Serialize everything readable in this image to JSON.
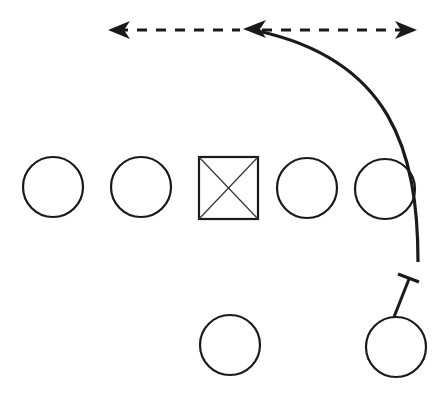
{
  "diagram": {
    "type": "football-play",
    "background": "#ffffff",
    "stroke": "#1a1a1a",
    "center": {
      "symbol": "square-with-x",
      "x": 200,
      "y": 158,
      "size": 58
    },
    "line_players": [
      {
        "id": "LT",
        "cx": 53,
        "cy": 187,
        "r": 30
      },
      {
        "id": "LG",
        "cx": 141,
        "cy": 187,
        "r": 30
      },
      {
        "id": "RG",
        "cx": 307,
        "cy": 188,
        "r": 30
      },
      {
        "id": "RT",
        "cx": 385,
        "cy": 189,
        "r": 30
      }
    ],
    "backfield_players": [
      {
        "id": "QB",
        "cx": 230,
        "cy": 345,
        "r": 30
      },
      {
        "id": "RB",
        "cx": 396,
        "cy": 347,
        "r": 30
      }
    ],
    "route": {
      "description": "curved route from right tackle area up to mid-field arrow",
      "path": "M 418 262 C 418 150 380 60 248 30"
    },
    "dashed_option": {
      "y": 30,
      "x_left": 110,
      "x_mid": 245,
      "x_right": 415
    },
    "block": {
      "x1": 396,
      "y1": 317,
      "x2": 408,
      "y2": 280,
      "bar_x1": 398,
      "bar_y1": 276,
      "bar_x2": 418,
      "bar_y2": 283
    }
  }
}
